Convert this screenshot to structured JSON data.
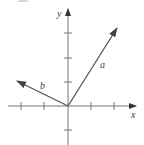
{
  "figure": {
    "problem_number_fragment": "30.",
    "axes": {
      "x_label": "x",
      "y_label": "y",
      "origin_px": [
        68,
        106
      ],
      "x_ticks_px": [
        21,
        44,
        91,
        114
      ],
      "y_ticks_px": [
        33,
        58,
        82,
        130
      ],
      "axis_color": "#666666"
    },
    "vectors": [
      {
        "name": "a",
        "label": "a",
        "tail_px": [
          68,
          106
        ],
        "tip_px": [
          117,
          28
        ],
        "color": "#555555"
      },
      {
        "name": "b",
        "label": "b",
        "tail_px": [
          68,
          106
        ],
        "tip_px": [
          17,
          81
        ],
        "color": "#555555"
      }
    ]
  }
}
